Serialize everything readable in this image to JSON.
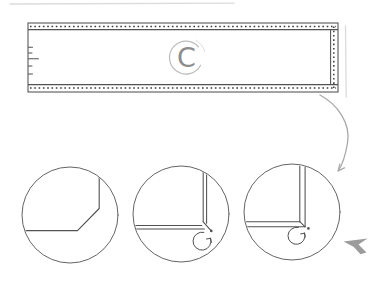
{
  "diagram": {
    "piece_label": "C",
    "colors": {
      "ink": "#515151",
      "stitch": "#3d3d3d",
      "outline": "#646464",
      "light": "#a9a9a9",
      "label": "#8c8c8c",
      "label_circle": "#bcbcbc",
      "cursor": "#9c9c9c",
      "artifact": "#dbdbdb"
    },
    "icons": {
      "flow_arrow": "curved-arrow",
      "fold_arrow": "circular-fold-arrow",
      "cursor": "cursor-arrowhead"
    }
  }
}
